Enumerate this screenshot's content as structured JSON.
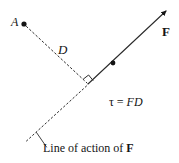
{
  "figure": {
    "name": "torque-moment-arm-diagram",
    "width": 179,
    "height": 163,
    "background_color": "#ffffff",
    "stroke_color": "#141414"
  },
  "labels": {
    "point_a": "A",
    "distance_d": "D",
    "force_f": "F",
    "torque_symbol": "τ",
    "torque_equals": " = ",
    "torque_rhs": "FD",
    "torque_equation": "τ = FD",
    "line_of_action_prefix": "Line of action of ",
    "line_of_action_force": "F",
    "line_of_action_full": "Line of action of F"
  },
  "geometry": {
    "point_a": {
      "x": 24,
      "y": 24,
      "radius": 2.6
    },
    "perpendicular_foot": {
      "x": 88,
      "y": 84
    },
    "force_line_dot": {
      "x": 113,
      "y": 63,
      "radius": 2.4
    },
    "force_arrow_tip": {
      "x": 169,
      "y": 8
    },
    "line_of_action_tail": {
      "x": 26,
      "y": 141
    },
    "moment_arm_dash": "2 3",
    "line_of_action_dash": "1.6 2.6",
    "right_angle_marker_size": 7,
    "leader_from": {
      "x": 47,
      "y": 146
    },
    "leader_to": {
      "x": 37,
      "y": 133
    }
  }
}
